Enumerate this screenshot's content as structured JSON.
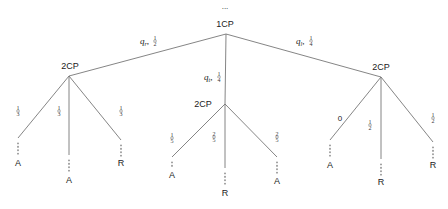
{
  "diagram": {
    "type": "probability-tree",
    "root": {
      "label": "1CP",
      "above": "...",
      "x": 226,
      "y": 34
    },
    "branches": [
      {
        "id": "left",
        "edge_label": {
          "var": "q",
          "sub": "r",
          "num": "1",
          "den": "2"
        },
        "node": {
          "label": "2CP",
          "x": 69,
          "y": 76
        },
        "children": [
          {
            "prob": {
              "num": "1",
              "den": "3"
            },
            "end_x": 18,
            "end_y": 138,
            "leaf": "A",
            "leaf_y": 166
          },
          {
            "prob": {
              "num": "1",
              "den": "3"
            },
            "end_x": 69,
            "end_y": 155,
            "leaf": "A",
            "leaf_y": 183
          },
          {
            "prob": {
              "num": "1",
              "den": "3"
            },
            "end_x": 121,
            "end_y": 140,
            "leaf": "R",
            "leaf_y": 166
          }
        ]
      },
      {
        "id": "middle",
        "edge_label": {
          "var": "q",
          "sub": "t",
          "num": "1",
          "den": "4"
        },
        "node": {
          "label": "2CP",
          "x": 225,
          "y": 104
        },
        "children": [
          {
            "prob": {
              "num": "1",
              "den": "5"
            },
            "end_x": 172,
            "end_y": 157,
            "leaf": "A",
            "leaf_y": 178
          },
          {
            "prob": {
              "num": "2",
              "den": "5"
            },
            "end_x": 225,
            "end_y": 168,
            "leaf": "R",
            "leaf_y": 196
          },
          {
            "prob": {
              "num": "2",
              "den": "5"
            },
            "end_x": 277,
            "end_y": 157,
            "leaf": "A",
            "leaf_y": 184
          }
        ]
      },
      {
        "id": "right",
        "edge_label": {
          "var": "q",
          "sub": "l",
          "num": "1",
          "den": "4"
        },
        "node": {
          "label": "2CP",
          "x": 381,
          "y": 77
        },
        "children": [
          {
            "prob": {
              "plain": "0"
            },
            "end_x": 330,
            "end_y": 140,
            "leaf": "A",
            "leaf_y": 168
          },
          {
            "prob": {
              "num": "1",
              "den": "2"
            },
            "end_x": 381,
            "end_y": 159,
            "leaf": "R",
            "leaf_y": 185
          },
          {
            "prob": {
              "num": "1",
              "den": "2"
            },
            "end_x": 433,
            "end_y": 142,
            "leaf": "R",
            "leaf_y": 168
          }
        ]
      }
    ]
  },
  "labels": {
    "root": "1CP",
    "root_ellipsis": "...",
    "level2": [
      "2CP",
      "2CP",
      "2CP"
    ],
    "edge_labels": [
      "q_r, 1/2",
      "q_t, 1/4",
      "q_l, 1/4"
    ],
    "leaf_probs": [
      [
        "1/3",
        "1/3",
        "1/3"
      ],
      [
        "1/5",
        "2/5",
        "2/5"
      ],
      [
        "0",
        "1/2",
        "1/2"
      ]
    ],
    "leaves": [
      [
        "A",
        "A",
        "R"
      ],
      [
        "A",
        "R",
        "A"
      ],
      [
        "A",
        "R",
        "R"
      ]
    ]
  }
}
